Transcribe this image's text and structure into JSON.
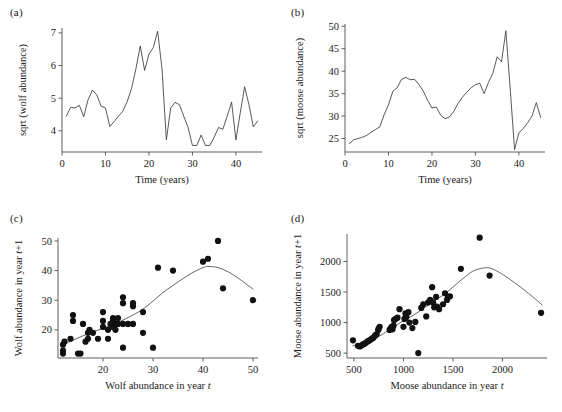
{
  "figure": {
    "panels": [
      {
        "id": "a",
        "label": "(a)"
      },
      {
        "id": "b",
        "label": "(b)"
      },
      {
        "id": "c",
        "label": "(c)"
      },
      {
        "id": "d",
        "label": "(d)"
      }
    ]
  },
  "panel_a": {
    "label": "(a)",
    "ylabel": "sqrt (wolf abundance)",
    "xlabel": "Time (years)",
    "xticks": [
      "0",
      "10",
      "20",
      "30",
      "40"
    ],
    "yticks": [
      "4",
      "5",
      "6",
      "7"
    ]
  },
  "panel_b": {
    "label": "(b)",
    "ylabel": "sqrt (moose abundance)",
    "xlabel": "Time (years)",
    "xticks": [
      "0",
      "10",
      "20",
      "30",
      "40"
    ],
    "yticks": [
      "25",
      "30",
      "35",
      "40",
      "45",
      "50"
    ]
  },
  "panel_c": {
    "label": "(c)",
    "ylabel_main": "Wolf abundance in year ",
    "ylabel_italic": "t",
    "ylabel_suffix": "+1",
    "xlabel_main": "Wolf abundance in year ",
    "xlabel_italic": "t",
    "xticks": [
      "20",
      "30",
      "40",
      "50"
    ],
    "yticks": [
      "20",
      "30",
      "40",
      "50"
    ]
  },
  "panel_d": {
    "label": "(d)",
    "ylabel_main": "Moose abundance in year ",
    "ylabel_italic": "t",
    "ylabel_suffix": "+1",
    "xlabel_main": "Moose abundance in year ",
    "xlabel_italic": "t",
    "xticks": [
      "500",
      "1000",
      "1500",
      "2000"
    ],
    "yticks": [
      "500",
      "1000",
      "1500",
      "2000"
    ]
  },
  "chart_data": [
    {
      "type": "line",
      "panel": "a",
      "title": "(a)",
      "xlabel": "Time (years)",
      "ylabel": "sqrt (wolf abundance)",
      "xlim": [
        0,
        46
      ],
      "ylim": [
        3.35,
        7.15
      ],
      "xticks": [
        0,
        10,
        20,
        30,
        40
      ],
      "yticks": [
        4,
        5,
        6,
        7
      ],
      "grid": false,
      "x": [
        1,
        2,
        3,
        4,
        5,
        6,
        7,
        8,
        9,
        10,
        11,
        12,
        13,
        14,
        15,
        16,
        17,
        18,
        19,
        20,
        21,
        22,
        23,
        24,
        25,
        26,
        27,
        28,
        29,
        30,
        31,
        32,
        33,
        34,
        35,
        36,
        37,
        38,
        39,
        40,
        41,
        42,
        43,
        44,
        45
      ],
      "y": [
        4.45,
        4.72,
        4.7,
        4.78,
        4.43,
        4.95,
        5.25,
        5.1,
        4.75,
        4.7,
        4.13,
        4.28,
        4.45,
        4.6,
        4.9,
        5.3,
        5.9,
        6.6,
        5.85,
        6.35,
        6.55,
        7.05,
        5.9,
        3.72,
        4.7,
        4.87,
        4.8,
        4.45,
        4.1,
        3.55,
        3.55,
        3.87,
        3.55,
        3.55,
        3.8,
        4.1,
        4.05,
        4.45,
        4.88,
        3.72,
        4.55,
        5.35,
        4.8,
        4.12,
        4.3
      ]
    },
    {
      "type": "line",
      "panel": "b",
      "title": "(b)",
      "xlabel": "Time (years)",
      "ylabel": "sqrt (moose abundance)",
      "xlim": [
        0,
        46
      ],
      "ylim": [
        22,
        50.5
      ],
      "xticks": [
        0,
        10,
        20,
        30,
        40
      ],
      "yticks": [
        25,
        30,
        35,
        40,
        45,
        50
      ],
      "grid": false,
      "x": [
        1,
        2,
        3,
        4,
        5,
        6,
        7,
        8,
        9,
        10,
        11,
        12,
        13,
        14,
        15,
        16,
        17,
        18,
        19,
        20,
        21,
        22,
        23,
        24,
        25,
        26,
        27,
        28,
        29,
        30,
        31,
        32,
        33,
        34,
        35,
        36,
        37,
        38,
        39,
        40,
        41,
        42,
        43,
        44,
        45
      ],
      "y": [
        23.9,
        24.7,
        25.0,
        25.3,
        25.7,
        26.4,
        27.0,
        27.6,
        30.3,
        32.5,
        35.5,
        36.3,
        38.2,
        38.6,
        38.1,
        38.2,
        37.0,
        35.6,
        33.5,
        31.8,
        32.0,
        30.2,
        29.4,
        29.8,
        31.0,
        32.8,
        34.2,
        35.3,
        36.3,
        37.0,
        37.3,
        35.0,
        37.5,
        39.5,
        43.2,
        42.1,
        49.0,
        36.0,
        22.5,
        26.3,
        27.2,
        28.5,
        30.0,
        33.0,
        29.7
      ]
    },
    {
      "type": "scatter",
      "panel": "c",
      "title": "(c)",
      "xlabel": "Wolf abundance in year t",
      "ylabel": "Wolf abundance in year t+1",
      "xlim": [
        11,
        51
      ],
      "ylim": [
        10.5,
        51
      ],
      "xticks": [
        20,
        30,
        40,
        50
      ],
      "yticks": [
        20,
        30,
        40,
        50
      ],
      "grid": false,
      "points": [
        [
          12,
          12
        ],
        [
          12,
          13
        ],
        [
          12,
          15
        ],
        [
          12.3,
          16
        ],
        [
          13.5,
          17
        ],
        [
          14,
          23
        ],
        [
          14,
          25
        ],
        [
          15,
          12
        ],
        [
          15.5,
          12
        ],
        [
          16,
          22
        ],
        [
          16.5,
          16
        ],
        [
          17,
          17
        ],
        [
          17,
          19
        ],
        [
          17.3,
          20
        ],
        [
          18,
          19
        ],
        [
          19,
          17
        ],
        [
          20,
          21
        ],
        [
          20,
          23
        ],
        [
          20,
          26
        ],
        [
          21,
          17
        ],
        [
          21,
          20
        ],
        [
          21.5,
          22
        ],
        [
          22,
          21
        ],
        [
          22,
          22
        ],
        [
          22,
          23
        ],
        [
          22,
          24
        ],
        [
          22.5,
          20
        ],
        [
          22.5,
          22
        ],
        [
          23,
          22
        ],
        [
          23,
          24
        ],
        [
          24,
          14
        ],
        [
          24,
          22
        ],
        [
          24,
          29
        ],
        [
          24,
          31
        ],
        [
          25,
          22
        ],
        [
          26,
          22
        ],
        [
          26,
          28
        ],
        [
          26,
          29
        ],
        [
          28,
          19
        ],
        [
          28,
          26
        ],
        [
          30,
          14
        ],
        [
          31,
          41
        ],
        [
          34,
          40
        ],
        [
          40,
          43
        ],
        [
          41,
          44
        ],
        [
          43,
          50
        ],
        [
          44,
          34
        ],
        [
          50,
          30
        ]
      ],
      "smoother": {
        "x": [
          12,
          14,
          16,
          18,
          20,
          22,
          24,
          26,
          28,
          30,
          32,
          34,
          36,
          38,
          40,
          41,
          43,
          45,
          47,
          50
        ],
        "y": [
          15.0,
          16.5,
          18.0,
          19.3,
          20.5,
          21.8,
          23.3,
          25.0,
          27.0,
          29.7,
          32.6,
          35.0,
          37.3,
          39.4,
          41.0,
          41.4,
          41.0,
          39.6,
          37.5,
          33.8
        ]
      }
    },
    {
      "type": "scatter",
      "panel": "d",
      "title": "(d)",
      "xlabel": "Moose abundance in year t",
      "ylabel": "Moose abundance in year t+1",
      "xlim": [
        430,
        2450
      ],
      "ylim": [
        420,
        2450
      ],
      "xticks": [
        500,
        1000,
        1500,
        2000
      ],
      "yticks": [
        500,
        1000,
        1500,
        2000
      ],
      "grid": false,
      "points": [
        [
          490,
          710
        ],
        [
          540,
          620
        ],
        [
          560,
          610
        ],
        [
          575,
          625
        ],
        [
          590,
          640
        ],
        [
          600,
          650
        ],
        [
          615,
          660
        ],
        [
          630,
          680
        ],
        [
          645,
          700
        ],
        [
          660,
          710
        ],
        [
          675,
          730
        ],
        [
          690,
          745
        ],
        [
          700,
          760
        ],
        [
          715,
          790
        ],
        [
          730,
          810
        ],
        [
          745,
          880
        ],
        [
          750,
          900
        ],
        [
          760,
          930
        ],
        [
          860,
          880
        ],
        [
          870,
          900
        ],
        [
          880,
          930
        ],
        [
          890,
          890
        ],
        [
          900,
          950
        ],
        [
          905,
          1040
        ],
        [
          920,
          1060
        ],
        [
          940,
          1080
        ],
        [
          960,
          1220
        ],
        [
          1000,
          930
        ],
        [
          1010,
          1060
        ],
        [
          1020,
          1150
        ],
        [
          1030,
          1090
        ],
        [
          1050,
          1170
        ],
        [
          1060,
          1000
        ],
        [
          1090,
          910
        ],
        [
          1120,
          1010
        ],
        [
          1150,
          500
        ],
        [
          1180,
          1240
        ],
        [
          1200,
          1300
        ],
        [
          1230,
          1100
        ],
        [
          1250,
          1330
        ],
        [
          1270,
          1370
        ],
        [
          1290,
          1580
        ],
        [
          1300,
          1330
        ],
        [
          1310,
          1250
        ],
        [
          1330,
          1420
        ],
        [
          1340,
          1260
        ],
        [
          1360,
          1220
        ],
        [
          1400,
          1300
        ],
        [
          1420,
          1480
        ],
        [
          1440,
          1370
        ],
        [
          1450,
          1420
        ],
        [
          1470,
          1430
        ],
        [
          1580,
          1880
        ],
        [
          1770,
          2390
        ],
        [
          1870,
          1770
        ],
        [
          2390,
          1160
        ]
      ],
      "smoother": {
        "x": [
          490,
          600,
          700,
          800,
          900,
          1000,
          1100,
          1200,
          1300,
          1400,
          1500,
          1600,
          1700,
          1800,
          1880,
          2000,
          2150,
          2300,
          2400
        ],
        "y": [
          620,
          660,
          730,
          820,
          930,
          1030,
          1120,
          1230,
          1340,
          1450,
          1580,
          1720,
          1840,
          1890,
          1890,
          1790,
          1620,
          1430,
          1290
        ]
      }
    }
  ]
}
